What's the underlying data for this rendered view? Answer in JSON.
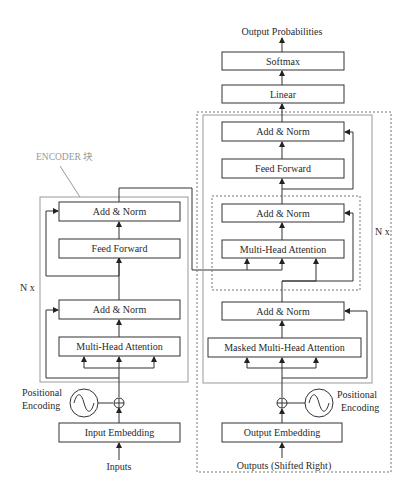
{
  "annotation": {
    "label": "ENCODER 块",
    "color": "#999999"
  },
  "encoder": {
    "repeat_label": "N x",
    "blocks": {
      "add_norm_top": "Add & Norm",
      "feed_forward": "Feed Forward",
      "add_norm_bottom": "Add & Norm",
      "multi_head_attention": "Multi-Head Attention",
      "input_embedding": "Input Embedding"
    },
    "positional_encoding": "Positional Encoding",
    "positional_encoding_lines": [
      "Positional",
      "Encoding"
    ],
    "input_label": "Inputs"
  },
  "decoder": {
    "repeat_label": "N x",
    "blocks": {
      "add_norm_top": "Add & Norm",
      "feed_forward": "Feed Forward",
      "add_norm_middle": "Add & Norm",
      "multi_head_attention": "Multi-Head Attention",
      "add_norm_bottom": "Add & Norm",
      "masked_multi_head_attention": "Masked Multi-Head Attention",
      "output_embedding": "Output Embedding"
    },
    "positional_encoding": "Positional Encoding",
    "positional_encoding_lines": [
      "Positional",
      "Encoding"
    ],
    "input_label": "Outputs (Shifted Right)"
  },
  "head": {
    "linear": "Linear",
    "softmax": "Softmax",
    "output_label": "Output Probabilities"
  },
  "colors": {
    "stroke": "#333333",
    "frame": "#999999",
    "dashed_frame": "#777777",
    "background": "#ffffff"
  }
}
